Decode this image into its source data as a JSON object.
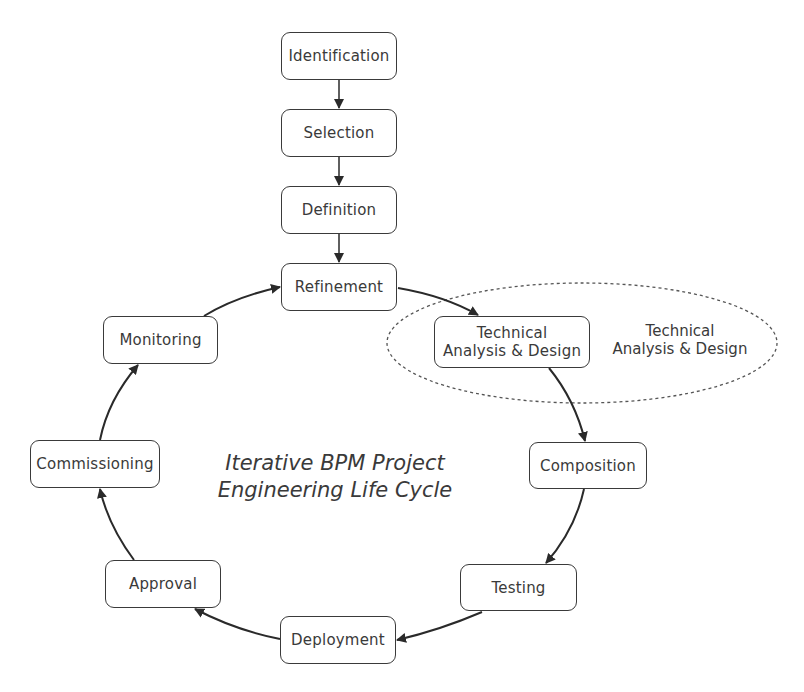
{
  "diagram": {
    "title_line1": "Iterative BPM Project",
    "title_line2": "Engineering Life Cycle",
    "nodes": {
      "identification": "Identification",
      "selection": "Selection",
      "definition": "Definition",
      "refinement": "Refinement",
      "technical_line1": "Technical",
      "technical_line2": "Analysis & Design",
      "composition": "Composition",
      "testing": "Testing",
      "deployment": "Deployment",
      "approval": "Approval",
      "commissioning": "Commissioning",
      "monitoring": "Monitoring"
    },
    "highlight": {
      "line1": "Technical",
      "line2": "Analysis & Design"
    },
    "edges": [
      [
        "Identification",
        "Selection"
      ],
      [
        "Selection",
        "Definition"
      ],
      [
        "Definition",
        "Refinement"
      ],
      [
        "Refinement",
        "Technical Analysis & Design"
      ],
      [
        "Technical Analysis & Design",
        "Composition"
      ],
      [
        "Composition",
        "Testing"
      ],
      [
        "Testing",
        "Deployment"
      ],
      [
        "Deployment",
        "Approval"
      ],
      [
        "Approval",
        "Commissioning"
      ],
      [
        "Commissioning",
        "Monitoring"
      ],
      [
        "Monitoring",
        "Refinement"
      ]
    ],
    "colors": {
      "stroke": "#3a3a3a",
      "background": "#ffffff"
    }
  }
}
